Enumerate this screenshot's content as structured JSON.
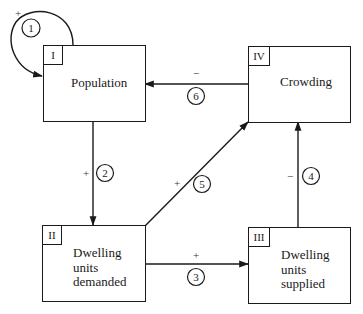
{
  "diagram": {
    "type": "causal-loop",
    "nodes": [
      {
        "id": "I",
        "label": "Population"
      },
      {
        "id": "II",
        "label": "Dwelling\nunits\ndemanded"
      },
      {
        "id": "III",
        "label": "Dwelling\nunits\nsupplied"
      },
      {
        "id": "IV",
        "label": "Crowding"
      }
    ],
    "edges": [
      {
        "number": "1",
        "from": "I",
        "to": "I",
        "sign": "+"
      },
      {
        "number": "2",
        "from": "I",
        "to": "II",
        "sign": "+"
      },
      {
        "number": "3",
        "from": "II",
        "to": "III",
        "sign": "+"
      },
      {
        "number": "4",
        "from": "III",
        "to": "IV",
        "sign": "−"
      },
      {
        "number": "5",
        "from": "II",
        "to": "IV",
        "sign": "+"
      },
      {
        "number": "6",
        "from": "IV",
        "to": "I",
        "sign": "−"
      }
    ]
  }
}
